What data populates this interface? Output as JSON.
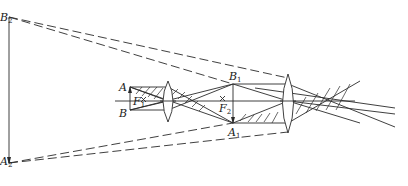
{
  "figure": {
    "labels": {
      "B2": {
        "main": "B",
        "sub": "2"
      },
      "A2": {
        "main": "A",
        "sub": "2"
      },
      "A": {
        "main": "A",
        "sub": ""
      },
      "B": {
        "main": "B",
        "sub": ""
      },
      "F1": {
        "main": "F",
        "sub": "1"
      },
      "F2": {
        "main": "F",
        "sub": "2"
      },
      "B1": {
        "main": "B",
        "sub": "1"
      },
      "A1": {
        "main": "A",
        "sub": "1"
      }
    },
    "elements": {
      "objective_lens": "lens-1",
      "eyepiece_lens": "lens-2",
      "object": "AB",
      "intermediate_image": "A1B1",
      "final_virtual_image": "A2B2"
    },
    "colors": {
      "line": "#2a2a2a",
      "background": "#ffffff"
    }
  }
}
